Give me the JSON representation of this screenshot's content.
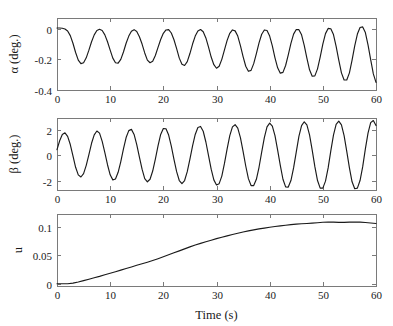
{
  "figure": {
    "background": "#ffffff",
    "line_color": "#1a1a1a",
    "axis_color": "#7a7a7a",
    "xlabel": "Time (s)"
  },
  "chart_data": [
    {
      "type": "line",
      "name": "alpha-vs-time",
      "title": "",
      "xlabel": "",
      "ylabel": "α (deg.)",
      "xlim": [
        0,
        60
      ],
      "ylim": [
        -0.4,
        0.07
      ],
      "xticks": [
        0,
        10,
        20,
        30,
        40,
        50,
        60
      ],
      "xticklabels": [
        "0",
        "10",
        "20",
        "30",
        "40",
        "50",
        "60"
      ],
      "yticks": [
        0,
        -0.2,
        -0.4
      ],
      "yticklabels": [
        "0",
        "-0.2",
        "-0.4"
      ],
      "grid": false,
      "legend": "none",
      "series": [
        {
          "name": "alpha",
          "x": [
            0,
            0.5,
            1,
            1.5,
            2,
            2.5,
            3,
            3.5,
            4,
            4.5,
            5,
            5.5,
            6,
            6.5,
            7,
            7.5,
            8,
            8.5,
            9,
            9.5,
            10,
            10.5,
            11,
            11.5,
            12,
            12.5,
            13,
            13.5,
            14,
            14.5,
            15,
            15.5,
            16,
            16.5,
            17,
            17.5,
            18,
            18.5,
            19,
            19.5,
            20,
            20.5,
            21,
            21.5,
            22,
            22.5,
            23,
            23.5,
            24,
            24.5,
            25,
            25.5,
            26,
            26.5,
            27,
            27.5,
            28,
            28.5,
            29,
            29.5,
            30,
            30.5,
            31,
            31.5,
            32,
            32.5,
            33,
            33.5,
            34,
            34.5,
            35,
            35.5,
            36,
            36.5,
            37,
            37.5,
            38,
            38.5,
            39,
            39.5,
            40,
            40.5,
            41,
            41.5,
            42,
            42.5,
            43,
            43.5,
            44,
            44.5,
            45,
            45.5,
            46,
            46.5,
            47,
            47.5,
            48,
            48.5,
            49,
            49.5,
            50,
            50.5,
            51,
            51.5,
            52,
            52.5,
            53,
            53.5,
            54,
            54.5,
            55,
            55.5,
            56,
            56.5,
            57,
            57.5,
            58,
            58.5,
            59,
            59.5,
            60
          ],
          "y": [
            0.005,
            0.005,
            0.003,
            -0.002,
            -0.015,
            -0.045,
            -0.095,
            -0.155,
            -0.205,
            -0.228,
            -0.222,
            -0.19,
            -0.14,
            -0.085,
            -0.04,
            -0.012,
            -0.004,
            -0.012,
            -0.04,
            -0.085,
            -0.14,
            -0.192,
            -0.222,
            -0.225,
            -0.2,
            -0.152,
            -0.095,
            -0.048,
            -0.016,
            -0.006,
            -0.018,
            -0.052,
            -0.1,
            -0.158,
            -0.205,
            -0.222,
            -0.212,
            -0.175,
            -0.122,
            -0.07,
            -0.03,
            -0.008,
            -0.006,
            -0.028,
            -0.072,
            -0.13,
            -0.192,
            -0.232,
            -0.24,
            -0.215,
            -0.162,
            -0.1,
            -0.048,
            -0.015,
            -0.005,
            -0.02,
            -0.06,
            -0.12,
            -0.185,
            -0.235,
            -0.258,
            -0.245,
            -0.2,
            -0.138,
            -0.076,
            -0.03,
            -0.008,
            -0.014,
            -0.048,
            -0.11,
            -0.182,
            -0.245,
            -0.278,
            -0.272,
            -0.228,
            -0.162,
            -0.092,
            -0.036,
            -0.008,
            -0.012,
            -0.048,
            -0.112,
            -0.19,
            -0.255,
            -0.29,
            -0.285,
            -0.24,
            -0.17,
            -0.096,
            -0.035,
            -0.005,
            -0.006,
            -0.04,
            -0.108,
            -0.192,
            -0.268,
            -0.31,
            -0.308,
            -0.262,
            -0.185,
            -0.1,
            -0.032,
            0.002,
            0.0,
            -0.038,
            -0.115,
            -0.205,
            -0.288,
            -0.335,
            -0.335,
            -0.288,
            -0.205,
            -0.112,
            -0.035,
            0.008,
            0.012,
            -0.025,
            -0.105,
            -0.202,
            -0.295,
            -0.35
          ]
        }
      ]
    },
    {
      "type": "line",
      "name": "beta-vs-time",
      "title": "",
      "xlabel": "",
      "ylabel": "β (deg.)",
      "xlim": [
        0,
        60
      ],
      "ylim": [
        -2.75,
        2.95
      ],
      "xticks": [
        0,
        10,
        20,
        30,
        40,
        50,
        60
      ],
      "xticklabels": [
        "0",
        "10",
        "20",
        "30",
        "40",
        "50",
        "60"
      ],
      "yticks": [
        2,
        0,
        -2
      ],
      "yticklabels": [
        "2",
        "0",
        "-2"
      ],
      "grid": false,
      "legend": "none",
      "series": [
        {
          "name": "beta",
          "x": [
            0,
            0.5,
            1,
            1.5,
            2,
            2.5,
            3,
            3.5,
            4,
            4.5,
            5,
            5.5,
            6,
            6.5,
            7,
            7.5,
            8,
            8.5,
            9,
            9.5,
            10,
            10.5,
            11,
            11.5,
            12,
            12.5,
            13,
            13.5,
            14,
            14.5,
            15,
            15.5,
            16,
            16.5,
            17,
            17.5,
            18,
            18.5,
            19,
            19.5,
            20,
            20.5,
            21,
            21.5,
            22,
            22.5,
            23,
            23.5,
            24,
            24.5,
            25,
            25.5,
            26,
            26.5,
            27,
            27.5,
            28,
            28.5,
            29,
            29.5,
            30,
            30.5,
            31,
            31.5,
            32,
            32.5,
            33,
            33.5,
            34,
            34.5,
            35,
            35.5,
            36,
            36.5,
            37,
            37.5,
            38,
            38.5,
            39,
            39.5,
            40,
            40.5,
            41,
            41.5,
            42,
            42.5,
            43,
            43.5,
            44,
            44.5,
            45,
            45.5,
            46,
            46.5,
            47,
            47.5,
            48,
            48.5,
            49,
            49.5,
            50,
            50.5,
            51,
            51.5,
            52,
            52.5,
            53,
            53.5,
            54,
            54.5,
            55,
            55.5,
            56,
            56.5,
            57,
            57.5,
            58,
            58.5,
            59,
            59.5,
            60
          ],
          "y": [
            0.45,
            1.15,
            1.65,
            1.78,
            1.5,
            0.85,
            -0.05,
            -0.95,
            -1.55,
            -1.72,
            -1.45,
            -0.8,
            0.05,
            0.95,
            1.62,
            1.92,
            1.75,
            1.1,
            0.2,
            -0.75,
            -1.55,
            -1.95,
            -1.88,
            -1.35,
            -0.5,
            0.5,
            1.4,
            1.95,
            2.05,
            1.65,
            0.85,
            -0.15,
            -1.1,
            -1.85,
            -2.1,
            -1.9,
            -1.25,
            -0.3,
            0.75,
            1.65,
            2.12,
            2.1,
            1.6,
            0.72,
            -0.32,
            -1.3,
            -2.0,
            -2.25,
            -2.0,
            -1.3,
            -0.3,
            0.75,
            1.65,
            2.2,
            2.28,
            1.9,
            1.05,
            -0.02,
            -1.1,
            -1.95,
            -2.35,
            -2.25,
            -1.65,
            -0.65,
            0.5,
            1.55,
            2.25,
            2.42,
            2.15,
            1.4,
            0.3,
            -0.85,
            -1.85,
            -2.4,
            -2.4,
            -1.9,
            -0.95,
            0.25,
            1.4,
            2.25,
            2.55,
            2.3,
            1.55,
            0.4,
            -0.8,
            -1.9,
            -2.5,
            -2.52,
            -2.0,
            -1.0,
            0.25,
            1.5,
            2.35,
            2.65,
            2.4,
            1.62,
            0.4,
            -0.9,
            -2.0,
            -2.6,
            -2.6,
            -2.05,
            -1.0,
            0.35,
            1.6,
            2.45,
            2.7,
            2.4,
            1.55,
            0.3,
            -1.0,
            -2.1,
            -2.65,
            -2.6,
            -2.0,
            -0.9,
            0.5,
            1.75,
            2.58,
            2.75,
            2.35,
            1.4
          ]
        }
      ]
    },
    {
      "type": "line",
      "name": "u-vs-time",
      "title": "",
      "xlabel": "Time (s)",
      "ylabel": "u",
      "xlim": [
        0,
        60
      ],
      "ylim": [
        -0.004,
        0.123
      ],
      "xticks": [
        0,
        10,
        20,
        30,
        40,
        50,
        60
      ],
      "xticklabels": [
        "0",
        "10",
        "20",
        "30",
        "40",
        "50",
        "60"
      ],
      "yticks": [
        0,
        0.05,
        0.1
      ],
      "yticklabels": [
        "0",
        "0.05",
        "0.1"
      ],
      "grid": false,
      "legend": "none",
      "series": [
        {
          "name": "u",
          "x": [
            0,
            1,
            2,
            3,
            4,
            5,
            6,
            7,
            8,
            9,
            10,
            11,
            12,
            13,
            14,
            15,
            16,
            17,
            18,
            19,
            20,
            21,
            22,
            23,
            24,
            25,
            26,
            27,
            28,
            29,
            30,
            31,
            32,
            33,
            34,
            35,
            36,
            37,
            38,
            39,
            40,
            41,
            42,
            43,
            44,
            45,
            46,
            47,
            48,
            49,
            50,
            51,
            52,
            53,
            54,
            55,
            56,
            57,
            58,
            59,
            60
          ],
          "y": [
            0.0,
            0.0,
            0.0,
            0.001,
            0.003,
            0.0055,
            0.008,
            0.0105,
            0.013,
            0.0158,
            0.0185,
            0.0212,
            0.024,
            0.0268,
            0.0296,
            0.0325,
            0.0352,
            0.038,
            0.041,
            0.0442,
            0.0475,
            0.051,
            0.0545,
            0.058,
            0.0615,
            0.065,
            0.0682,
            0.0712,
            0.074,
            0.0768,
            0.0795,
            0.082,
            0.0845,
            0.0868,
            0.089,
            0.0912,
            0.0932,
            0.095,
            0.0967,
            0.0982,
            0.0996,
            0.1009,
            0.102,
            0.1032,
            0.1043,
            0.1052,
            0.1058,
            0.1062,
            0.1068,
            0.1076,
            0.1084,
            0.1088,
            0.1086,
            0.1082,
            0.1082,
            0.1086,
            0.1089,
            0.1086,
            0.108,
            0.1072,
            0.1062
          ]
        }
      ]
    }
  ]
}
